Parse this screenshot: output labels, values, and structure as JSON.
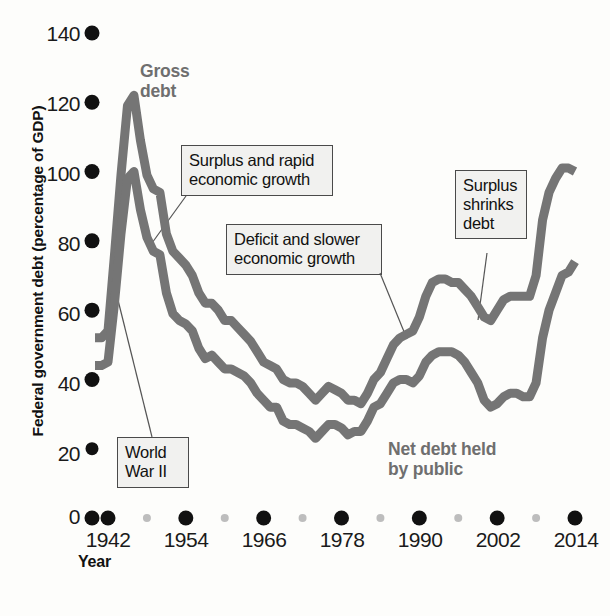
{
  "chart_data": {
    "type": "line",
    "title": "",
    "xlabel": "Year",
    "ylabel": "Federal government debt (percentage of GDP)",
    "xlim": [
      1940,
      2015
    ],
    "ylim": [
      0,
      140
    ],
    "grid": false,
    "legend_position": "inline-annotations",
    "x_ticks": [
      "1942",
      "1954",
      "1966",
      "1978",
      "1990",
      "2002",
      "2014"
    ],
    "y_ticks": [
      "0",
      "20",
      "40",
      "60",
      "80",
      "100",
      "120",
      "140"
    ],
    "series": [
      {
        "name": "Gross debt",
        "color": "#757575",
        "x": [
          1940,
          1941,
          1942,
          1943,
          1944,
          1945,
          1946,
          1947,
          1948,
          1949,
          1950,
          1951,
          1952,
          1953,
          1954,
          1955,
          1956,
          1957,
          1958,
          1959,
          1960,
          1961,
          1962,
          1963,
          1964,
          1965,
          1966,
          1967,
          1968,
          1969,
          1970,
          1971,
          1972,
          1973,
          1974,
          1975,
          1976,
          1977,
          1978,
          1979,
          1980,
          1981,
          1982,
          1983,
          1984,
          1985,
          1986,
          1987,
          1988,
          1989,
          1990,
          1991,
          1992,
          1993,
          1994,
          1995,
          1996,
          1997,
          1998,
          1999,
          2000,
          2001,
          2002,
          2003,
          2004,
          2005,
          2006,
          2007,
          2008,
          2009,
          2010,
          2011,
          2012,
          2013,
          2014
        ],
        "values": [
          52,
          52,
          54,
          76,
          99,
          119,
          122,
          109,
          99,
          95,
          94,
          82,
          77,
          75,
          73,
          70,
          65,
          62,
          62,
          60,
          57,
          57,
          55,
          53,
          51,
          48,
          45,
          44,
          43,
          40,
          39,
          39,
          38,
          36,
          34,
          36,
          38,
          37,
          36,
          34,
          34,
          33,
          36,
          40,
          42,
          46,
          50,
          52,
          53,
          54,
          58,
          64,
          68,
          69,
          69,
          68,
          68,
          66,
          64,
          61,
          58,
          57,
          60,
          63,
          64,
          64,
          64,
          64,
          70,
          86,
          94,
          98,
          101,
          101,
          100
        ]
      },
      {
        "name": "Net debt held by public",
        "color": "#757575",
        "x": [
          1940,
          1941,
          1942,
          1943,
          1944,
          1945,
          1946,
          1947,
          1948,
          1949,
          1950,
          1951,
          1952,
          1953,
          1954,
          1955,
          1956,
          1957,
          1958,
          1959,
          1960,
          1961,
          1962,
          1963,
          1964,
          1965,
          1966,
          1967,
          1968,
          1969,
          1970,
          1971,
          1972,
          1973,
          1974,
          1975,
          1976,
          1977,
          1978,
          1979,
          1980,
          1981,
          1982,
          1983,
          1984,
          1985,
          1986,
          1987,
          1988,
          1989,
          1990,
          1991,
          1992,
          1993,
          1994,
          1995,
          1996,
          1997,
          1998,
          1999,
          2000,
          2001,
          2002,
          2003,
          2004,
          2005,
          2006,
          2007,
          2008,
          2009,
          2010,
          2011,
          2012,
          2013,
          2014
        ],
        "values": [
          44,
          44,
          45,
          62,
          82,
          98,
          100,
          89,
          81,
          77,
          76,
          65,
          59,
          57,
          56,
          54,
          49,
          46,
          47,
          45,
          43,
          43,
          42,
          41,
          39,
          36,
          34,
          32,
          32,
          28,
          27,
          27,
          26,
          25,
          23,
          25,
          27,
          27,
          26,
          24,
          25,
          25,
          28,
          32,
          33,
          36,
          39,
          40,
          40,
          39,
          41,
          45,
          47,
          48,
          48,
          48,
          47,
          45,
          42,
          39,
          34,
          32,
          33,
          35,
          36,
          36,
          35,
          35,
          39,
          52,
          60,
          65,
          70,
          71,
          74
        ]
      }
    ],
    "annotations": [
      {
        "id": "gross-debt-label",
        "text": "Gross\ndebt",
        "kind": "series-label"
      },
      {
        "id": "net-debt-label",
        "text": "Net debt held\nby public",
        "kind": "series-label"
      },
      {
        "id": "world-war-ii",
        "text": "World\nWar II",
        "kind": "callout"
      },
      {
        "id": "surplus-rapid-growth",
        "text": "Surplus and rapid\neconomic growth",
        "kind": "callout"
      },
      {
        "id": "deficit-slower-growth",
        "text": "Deficit and slower\neconomic growth",
        "kind": "callout"
      },
      {
        "id": "surplus-shrinks-debt",
        "text": "Surplus\nshrinks\ndebt",
        "kind": "callout"
      }
    ]
  },
  "axis": {
    "y_title": "Federal government debt (percentage of GDP)",
    "x_title": "Year",
    "y_ticks": [
      "140",
      "120",
      "100",
      "80",
      "60",
      "40",
      "20",
      "0"
    ],
    "x_ticks": [
      "1942",
      "1954",
      "1966",
      "1978",
      "1990",
      "2002",
      "2014"
    ]
  },
  "labels": {
    "gross_debt_line1": "Gross",
    "gross_debt_line2": "debt",
    "net_debt_line1": "Net debt held",
    "net_debt_line2": "by public",
    "world_war_line1": "World",
    "world_war_line2": "War II",
    "surplus_rapid_line1": "Surplus and rapid",
    "surplus_rapid_line2": "economic growth",
    "deficit_slower_line1": "Deficit and slower",
    "deficit_slower_line2": "economic growth",
    "surplus_shrinks_line1": "Surplus",
    "surplus_shrinks_line2": "shrinks",
    "surplus_shrinks_line3": "debt"
  },
  "colors": {
    "line": "#757575",
    "tick_major": "#111111",
    "tick_minor": "#bdbdbd",
    "callout_bg": "#f1f1ef",
    "callout_border": "#4a4a4a",
    "series_label": "#6f6f6f",
    "background": "#fdfdfb"
  }
}
